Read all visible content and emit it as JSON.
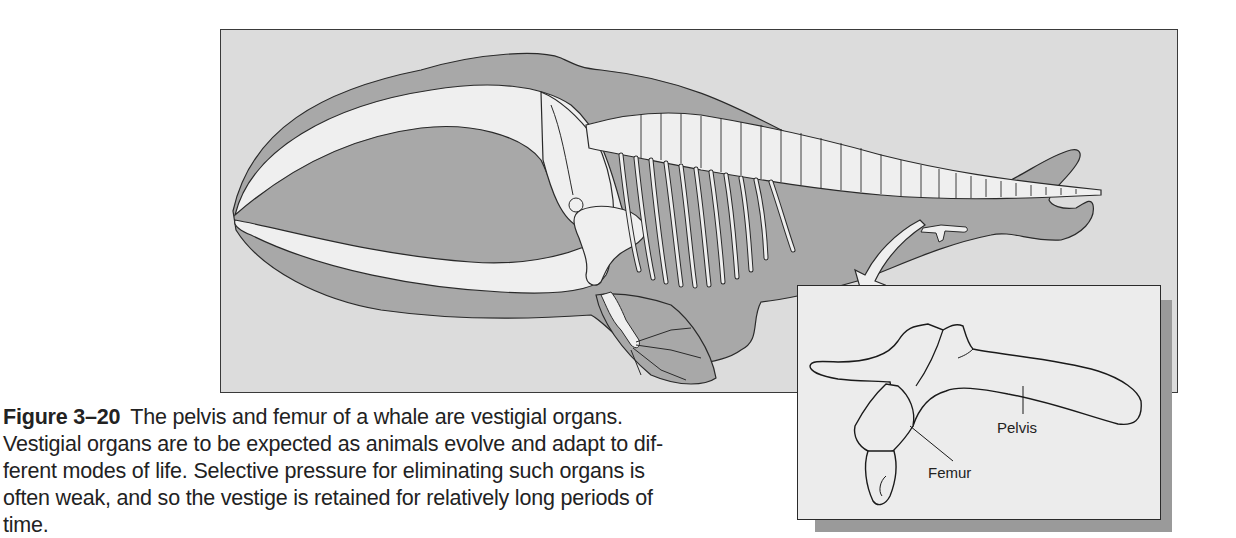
{
  "figure": {
    "number": "Figure 3–20",
    "colors": {
      "background_panel": "#dcdcdc",
      "whale_body": "#a8a8a8",
      "bone": "#efefef",
      "outline": "#2a2a2a",
      "inset_background": "#ececec",
      "inset_shadow": "#9a9a9a"
    }
  },
  "inset": {
    "labels": {
      "pelvis": "Pelvis",
      "femur": "Femur"
    }
  },
  "caption": {
    "figure_label": "Figure 3–20",
    "lines": [
      "The pelvis and femur of a whale are vestigial organs.",
      "Vestigial organs are to be expected as animals evolve and adapt to dif-",
      "ferent modes of life. Selective pressure for eliminating such organs is",
      "often weak, and so the vestige is retained for relatively long periods of",
      "time."
    ]
  }
}
